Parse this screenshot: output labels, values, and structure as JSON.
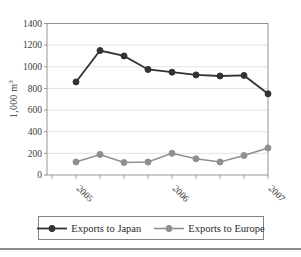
{
  "chart_data": {
    "type": "line",
    "title": "",
    "ylabel": "1,000 m³",
    "ylabel_parts": {
      "base": "1,000 m",
      "exponent": "3"
    },
    "ylim": [
      0,
      1400
    ],
    "ytick_step": 200,
    "ytick_labels": [
      "0",
      "200",
      "400",
      "600",
      "800",
      "1000",
      "1200",
      "1400"
    ],
    "x_year_labels": [
      {
        "label": "2005",
        "point_index": 0
      },
      {
        "label": "2006",
        "point_index": 4
      },
      {
        "label": "2007",
        "point_index": 8
      }
    ],
    "grid": "horizontal-light",
    "legend_position": "bottom",
    "series": [
      {
        "name": "Exports to Japan",
        "color": "#333333",
        "values": [
          860,
          1150,
          1100,
          975,
          950,
          925,
          915,
          920,
          750
        ]
      },
      {
        "name": "Exports to Europe",
        "color": "#8f8f8f",
        "values": [
          120,
          190,
          115,
          120,
          200,
          150,
          120,
          180,
          250
        ]
      }
    ],
    "colors": {
      "gridline": "#e2e2e2",
      "axis_border": "#959595",
      "tick_text": "#3a3a3a"
    }
  }
}
